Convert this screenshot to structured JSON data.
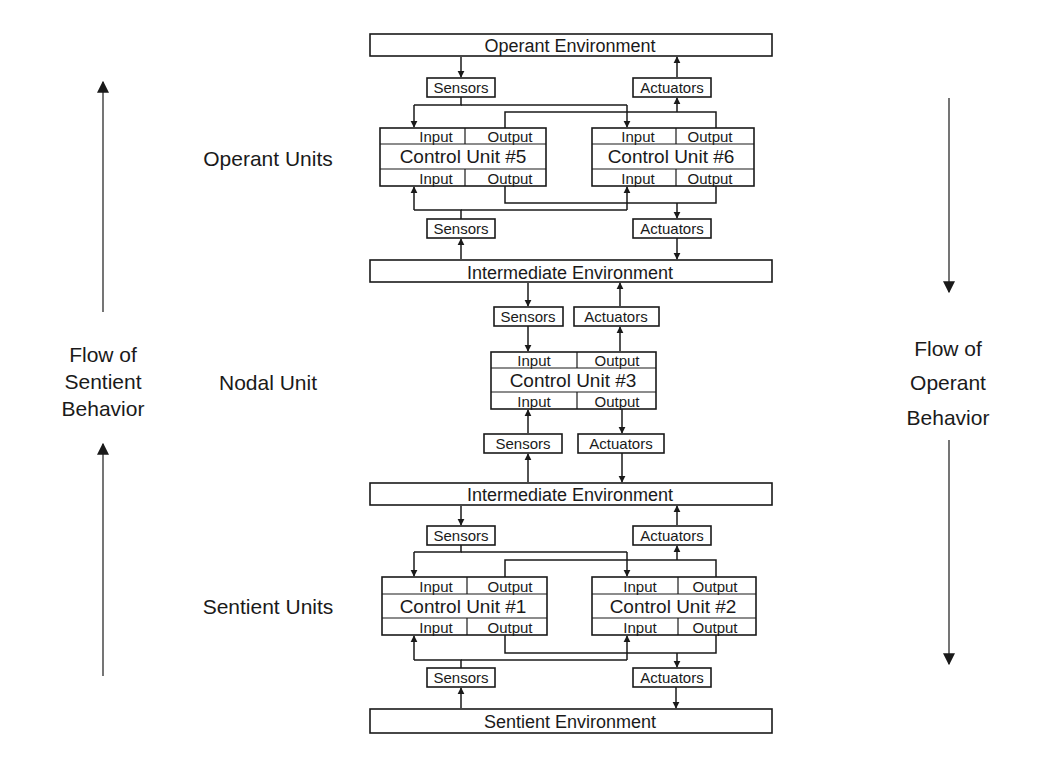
{
  "flows": {
    "left": {
      "lines": [
        "Flow of",
        "Sentient",
        "Behavior"
      ],
      "direction": "up"
    },
    "right": {
      "lines": [
        "Flow of",
        "Operant",
        "Behavior"
      ],
      "direction": "down"
    }
  },
  "groups": {
    "operant": "Operant Units",
    "nodal": "Nodal Unit",
    "sentient": "Sentient Units"
  },
  "environments": {
    "operant": "Operant Environment",
    "intermediate_upper": "Intermediate Environment",
    "intermediate_lower": "Intermediate Environment",
    "sentient": "Sentient Environment"
  },
  "interfaces": {
    "sensors": "Sensors",
    "actuators": "Actuators"
  },
  "ports": {
    "input": "Input",
    "output": "Output"
  },
  "control_units": {
    "cu5": "Control Unit #5",
    "cu6": "Control Unit #6",
    "cu3": "Control Unit #3",
    "cu1": "Control Unit #1",
    "cu2": "Control Unit #2"
  },
  "colors": {
    "ink": "#1a1a1a",
    "background": "#ffffff"
  }
}
